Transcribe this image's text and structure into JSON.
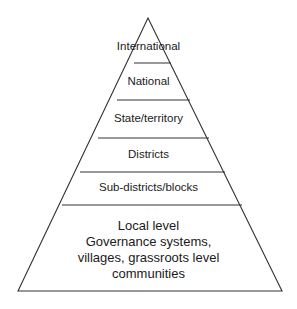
{
  "diagram": {
    "type": "pyramid",
    "colors": {
      "stroke": "#333333",
      "background": "#ffffff",
      "text": "#1a1a1a"
    },
    "levels": [
      {
        "label": "International"
      },
      {
        "label": "National"
      },
      {
        "label": "State/territory"
      },
      {
        "label": "Districts"
      },
      {
        "label": "Sub-districts/blocks"
      },
      {
        "label": "Local level",
        "lines": [
          "Local level",
          "Governance systems,",
          "villages, grassroots level",
          "communities"
        ]
      }
    ]
  }
}
